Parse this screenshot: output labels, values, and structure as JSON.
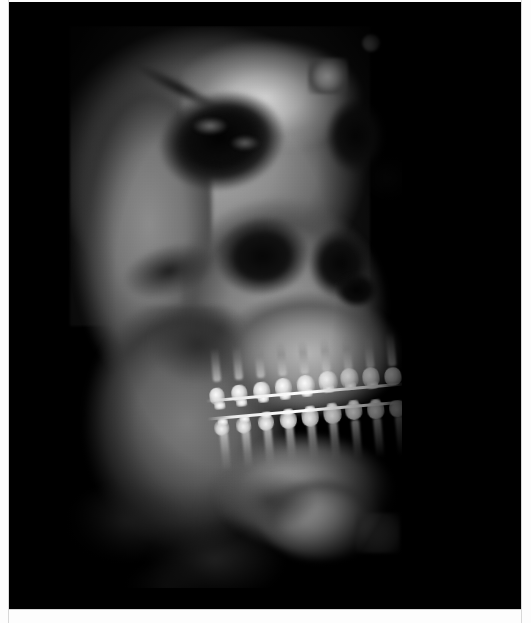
{
  "page": {
    "width": 531,
    "height": 623,
    "background_color": "#ffffff",
    "margin_color": "#fdfdfd"
  },
  "viewer": {
    "name": "ct-volume-viewer",
    "background_color": "#000000",
    "left": 9,
    "top": 2,
    "width": 512,
    "height": 608,
    "overlay_text": "",
    "annotations": []
  },
  "scan": {
    "modality": "CBCT",
    "rendering": "3D volume rendering",
    "view": "oblique right lateral",
    "subject": "human skull",
    "colormap": "grayscale",
    "volume_box": {
      "left": 53,
      "top": 24,
      "width": 340,
      "height": 562
    },
    "findings": [
      "orthodontic brackets bonded to maxillary and mandibular dentition",
      "continuous archwire visible across upper and lower arches",
      "right orbit rendered as large dark cavity",
      "maxillary sinus and nasal cavity appear as low-density dark regions",
      "bright high-density mental protuberance at chin",
      "soft-tissue / submandibular region appears mottled dark"
    ]
  },
  "anatomy": [
    {
      "id": "cranium",
      "label": "Cranial vault"
    },
    {
      "id": "frontal-bright",
      "label": "Frontal bone"
    },
    {
      "id": "temporal-left",
      "label": "Temporal bone"
    },
    {
      "id": "orbit-right",
      "label": "Right orbit"
    },
    {
      "id": "orbit-left",
      "label": "Left orbital rim"
    },
    {
      "id": "zygo-shadow",
      "label": "Zygomatic arch"
    },
    {
      "id": "sinus-max",
      "label": "Maxillary sinus"
    },
    {
      "id": "nasal-cavity",
      "label": "Nasal aperture"
    },
    {
      "id": "maxilla",
      "label": "Maxilla"
    },
    {
      "id": "ramus",
      "label": "Mandibular ramus"
    },
    {
      "id": "mandible-body",
      "label": "Mandibular body"
    },
    {
      "id": "chin-bright",
      "label": "Mental protuberance"
    },
    {
      "id": "neck-tissue",
      "label": "Submandibular soft tissue"
    },
    {
      "id": "teeth-band",
      "label": "Dentition with fixed orthodontic appliance"
    }
  ],
  "dentition": {
    "upper_crowns": 9,
    "lower_crowns": 9,
    "upper_brackets": 8,
    "lower_brackets": 8,
    "archwires": 2
  }
}
